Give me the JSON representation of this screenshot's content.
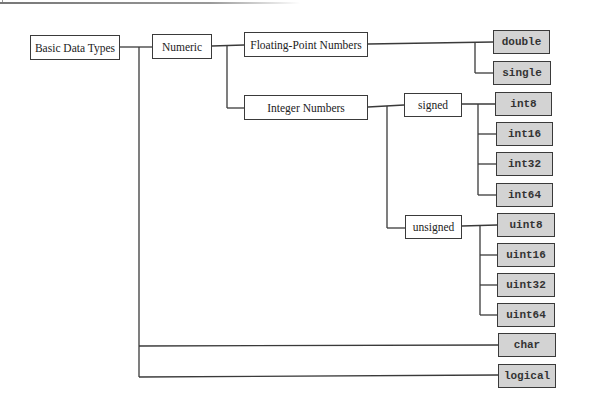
{
  "diagram": {
    "root": {
      "label": "Basic Data Types"
    },
    "numeric": {
      "label": "Numeric"
    },
    "floating": {
      "label": "Floating-Point Numbers"
    },
    "integer": {
      "label": "Integer Numbers"
    },
    "signed": {
      "label": "signed"
    },
    "unsigned": {
      "label": "unsigned"
    },
    "leaves": {
      "double": "double",
      "single": "single",
      "int8": "int8",
      "int16": "int16",
      "int32": "int32",
      "int64": "int64",
      "uint8": "uint8",
      "uint16": "uint16",
      "uint32": "uint32",
      "uint64": "uint64",
      "char": "char",
      "logical": "logical"
    },
    "colors": {
      "leaf_fill": "#d3d3d3",
      "border": "#3a3a3a",
      "category_fill": "#ffffff"
    }
  }
}
